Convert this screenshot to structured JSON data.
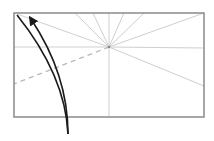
{
  "diagram": {
    "type": "origami-fold-diagram",
    "colors": {
      "paper_border": "#8a8a8a",
      "crease": "#cfcfcf",
      "valley_fold_dashed": "#b8b8b8",
      "arrow": "#1a1a1a",
      "background": "#ffffff"
    },
    "paper": {
      "x": 14,
      "y": 13,
      "width": 190,
      "height": 104
    },
    "center": {
      "x": 109,
      "y": 47
    },
    "creases": [
      {
        "x2": 17,
        "y2": 14
      },
      {
        "x2": 75,
        "y2": 13
      },
      {
        "x2": 93,
        "y2": 13
      },
      {
        "x2": 109,
        "y2": 13
      },
      {
        "x2": 124,
        "y2": 13
      },
      {
        "x2": 144,
        "y2": 13
      },
      {
        "x2": 204,
        "y2": 13
      },
      {
        "x2": 14,
        "y2": 47
      },
      {
        "x2": 204,
        "y2": 48
      },
      {
        "x2": 204,
        "y2": 86
      },
      {
        "x2": 109,
        "y2": 117
      }
    ],
    "dashed_fold": {
      "x2": 14,
      "y2": 84
    },
    "arrows": [
      {
        "name": "fold-arrow-outer",
        "path": "M 68 134 C 66 90, 45 50, 17 15",
        "arrowhead": false
      },
      {
        "name": "fold-arrow-inner",
        "path": "M 68 134 C 68 95, 55 55, 31 19",
        "arrowhead": true
      }
    ]
  }
}
